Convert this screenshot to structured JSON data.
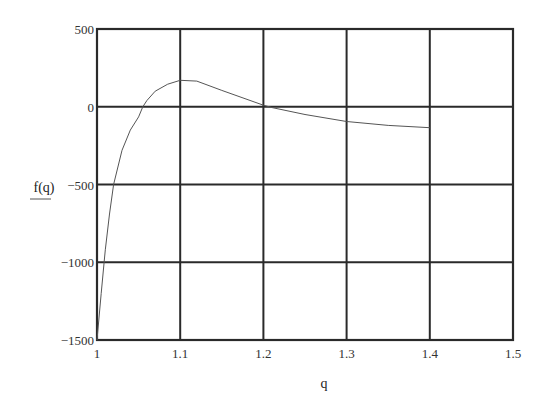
{
  "chart_data": {
    "type": "line",
    "title": "",
    "xlabel": "q",
    "ylabel": "f(q)",
    "xlim": [
      1,
      1.5
    ],
    "ylim": [
      -1500,
      500
    ],
    "grid": true,
    "legend": null,
    "x_ticks": [
      1,
      1.1,
      1.2,
      1.3,
      1.4,
      1.5
    ],
    "x_tick_labels": [
      "1",
      "1.1",
      "1.2",
      "1.3",
      "1.4",
      "1.5"
    ],
    "y_ticks": [
      500,
      0,
      -500,
      -1000,
      -1500
    ],
    "y_tick_labels": [
      "500",
      "0",
      "−500",
      "−1000",
      "−1500"
    ],
    "series": [
      {
        "name": "f(q)",
        "color": "#555555",
        "x": [
          1.0,
          1.005,
          1.01,
          1.015,
          1.02,
          1.03,
          1.04,
          1.05,
          1.055,
          1.06,
          1.07,
          1.085,
          1.1,
          1.12,
          1.15,
          1.2,
          1.21,
          1.25,
          1.3,
          1.35,
          1.4
        ],
        "y": [
          -1500,
          -1200,
          -920,
          -690,
          -500,
          -280,
          -150,
          -65,
          0,
          40,
          100,
          145,
          170,
          165,
          105,
          10,
          -5,
          -50,
          -95,
          -120,
          -135
        ]
      }
    ]
  },
  "labels": {
    "xlabel": "q",
    "ylabel": "f(q)"
  },
  "colors": {
    "frame": "#2a2a2a",
    "grid": "#2a2a2a",
    "curve": "#555555",
    "background": "#ffffff"
  }
}
